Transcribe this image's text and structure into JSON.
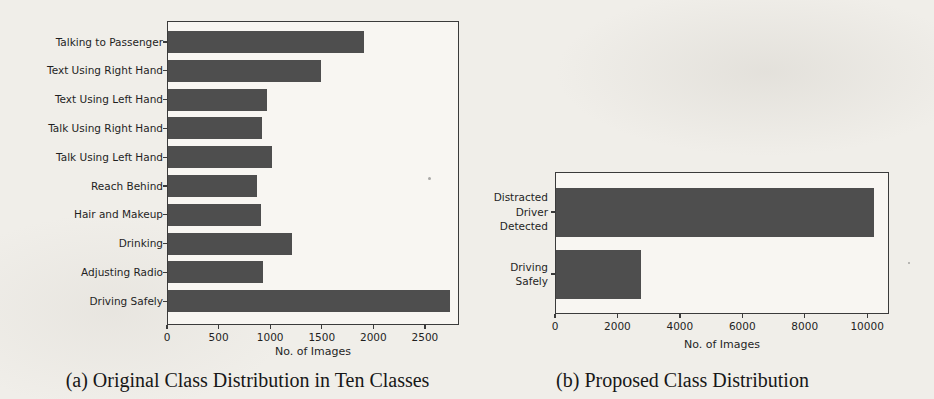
{
  "colors": {
    "background": "#f0eee9",
    "plot_background": "#f8f6f2",
    "bar": "#4e4e4e",
    "axis": "#3b3b3b",
    "text": "#1f1f1f"
  },
  "chart_data": [
    {
      "type": "bar",
      "orientation": "horizontal",
      "title": "",
      "caption": "(a) Original Class Distribution in Ten Classes",
      "categories": [
        "Talking to Passenger",
        "Text Using Right Hand",
        "Text Using Left Hand",
        "Talk Using Right Hand",
        "Talk Using Left Hand",
        "Reach Behind",
        "Hair and Makeup",
        "Drinking",
        "Adjusting Radio",
        "Driving Safely"
      ],
      "values": [
        1900,
        1480,
        960,
        910,
        1010,
        860,
        900,
        1200,
        920,
        2730
      ],
      "xlabel": "No. of Images",
      "xticks": [
        0,
        500,
        1000,
        1500,
        2000,
        2500
      ],
      "xlim": [
        0,
        2830
      ],
      "grid": false,
      "legend": null
    },
    {
      "type": "bar",
      "orientation": "horizontal",
      "title": "",
      "caption": "(b) Proposed Class Distribution",
      "categories": [
        [
          "Distracted",
          "Driver",
          "Detected"
        ],
        [
          "Driving",
          "Safely"
        ]
      ],
      "values": [
        10200,
        2730
      ],
      "xlabel": "No. of Images",
      "xticks": [
        0,
        2000,
        4000,
        6000,
        8000,
        10000
      ],
      "xlim": [
        0,
        10700
      ],
      "grid": false,
      "legend": null
    }
  ]
}
